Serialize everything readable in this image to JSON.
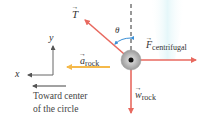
{
  "diagram": {
    "type": "free-body diagram",
    "object": "rock",
    "forces": [
      {
        "id": "tension",
        "symbol": "T",
        "subscript": "",
        "direction": "up-left",
        "color": "#e8695f"
      },
      {
        "id": "centrifugal",
        "symbol": "F",
        "subscript": "centrifugal",
        "direction": "right",
        "color": "#e8695f"
      },
      {
        "id": "weight",
        "symbol": "w",
        "subscript": "rock",
        "direction": "down",
        "color": "#e8695f"
      }
    ],
    "acceleration": {
      "symbol": "a",
      "subscript": "rock",
      "direction": "left",
      "color": "#f5b94a"
    },
    "angle": {
      "symbol": "θ",
      "color": "#3a8fd6"
    },
    "axes": {
      "x_label": "x",
      "y_label": "y"
    },
    "center_note": {
      "line1": "Toward center",
      "line2": "of the circle"
    }
  },
  "colors": {
    "force": "#e8695f",
    "acceleration": "#f5b94a",
    "angle_arc": "#3a8fd6",
    "axis": "#666666",
    "rock": "#b8b8b8",
    "background_streak": "#e6f7fa"
  }
}
